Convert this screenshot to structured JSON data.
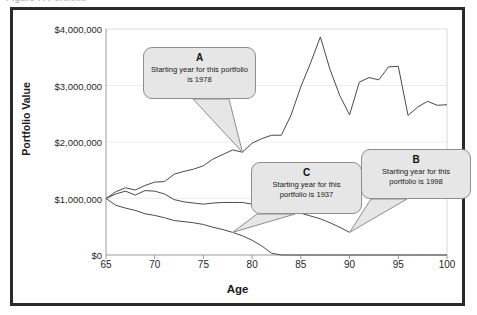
{
  "figure": {
    "caption": "Figure 7. Portfolio"
  },
  "chart_data": {
    "type": "line",
    "title": "",
    "xlabel": "Age",
    "ylabel": "Portfolio Value",
    "xlim": [
      65,
      100
    ],
    "ylim": [
      0,
      4000000
    ],
    "xticks": [
      65,
      70,
      75,
      80,
      85,
      90,
      95,
      100
    ],
    "xtick_labels": [
      "65",
      "70",
      "75",
      "80",
      "85",
      "90",
      "95",
      "100"
    ],
    "yticks": [
      0,
      1000000,
      2000000,
      3000000,
      4000000
    ],
    "ytick_labels": [
      "$0",
      "$1,000,000",
      "$2,000,000",
      "$3,000,000",
      "$4,000,000"
    ],
    "grid": "horizontal",
    "legend": "none",
    "line_color": "#4a4a4a",
    "series": [
      {
        "name": "A",
        "start_year": 1978,
        "x": [
          65,
          66,
          67,
          68,
          69,
          70,
          71,
          72,
          73,
          74,
          75,
          76,
          77,
          78,
          79,
          80,
          81,
          82,
          83,
          84,
          85,
          86,
          87,
          88,
          89,
          90,
          91,
          92,
          93,
          94,
          95,
          96,
          97,
          98,
          99,
          100
        ],
        "values": [
          1000000,
          1120000,
          1190000,
          1150000,
          1230000,
          1290000,
          1300000,
          1430000,
          1480000,
          1520000,
          1580000,
          1700000,
          1780000,
          1860000,
          1820000,
          1980000,
          2060000,
          2120000,
          2120000,
          2480000,
          2980000,
          3400000,
          3860000,
          3280000,
          2820000,
          2480000,
          3060000,
          3140000,
          3100000,
          3330000,
          3340000,
          2470000,
          2620000,
          2720000,
          2650000,
          2660000
        ]
      },
      {
        "name": "B",
        "start_year": 1998,
        "x": [
          65,
          66,
          67,
          68,
          69,
          70,
          71,
          72,
          73,
          74,
          75,
          76,
          77,
          78,
          79,
          80,
          81,
          82,
          83,
          84,
          85,
          86,
          87,
          88,
          89,
          90
        ],
        "values": [
          1000000,
          1080000,
          1130000,
          1060000,
          1140000,
          1130000,
          1080000,
          980000,
          940000,
          920000,
          900000,
          920000,
          930000,
          930000,
          930000,
          900000,
          850000,
          790000,
          790000,
          800000,
          740000,
          690000,
          640000,
          570000,
          490000,
          400000
        ]
      },
      {
        "name": "C",
        "start_year": 1937,
        "x": [
          65,
          66,
          67,
          68,
          69,
          70,
          71,
          72,
          73,
          74,
          75,
          76,
          77,
          78,
          79,
          80,
          81,
          82,
          83,
          84,
          85,
          86,
          87,
          88,
          89,
          90,
          91,
          92,
          93,
          94,
          95,
          96,
          97,
          98,
          99,
          100
        ],
        "values": [
          1000000,
          880000,
          830000,
          790000,
          730000,
          700000,
          660000,
          610000,
          590000,
          570000,
          540000,
          490000,
          450000,
          400000,
          340000,
          260000,
          160000,
          30000,
          0,
          0,
          0,
          0,
          0,
          0,
          0,
          0,
          0,
          0,
          0,
          0,
          0,
          0,
          0,
          0,
          0,
          0
        ]
      }
    ],
    "annotations": [
      {
        "tag": "A",
        "text": "Starting year for this portfolio is 1978",
        "points_to_series": "A",
        "points_to_age": 79
      },
      {
        "tag": "B",
        "text": "Starting year for this portfolio is 1998",
        "points_to_series": "B",
        "points_to_age": 90
      },
      {
        "tag": "C",
        "text": "Starting year for this portfolio is 1937",
        "points_to_series": "C",
        "points_to_age": 78
      }
    ]
  }
}
